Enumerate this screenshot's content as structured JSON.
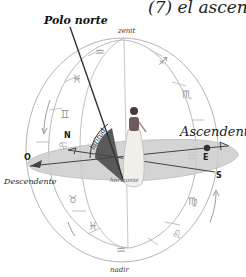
{
  "title_fragment": "(7) el ascen",
  "labels": {
    "polo_norte": "Polo norte",
    "zenit": "zenit",
    "nadir": "nadir",
    "ascendente": "Ascendente",
    "descendente": "Descendente",
    "horizonte": "horizonte",
    "latitud": "latitud"
  },
  "cardinals": {
    "north": "N",
    "south": "S",
    "east": "E",
    "west": "O"
  },
  "zodiac_signs": {
    "top_left_1": "♒",
    "top_left_2": "♓",
    "left": "♊",
    "left_low": "♋",
    "top_right": "♐",
    "right": "♏",
    "right_low_1": "♍",
    "right_low_2": "♌",
    "bottom_left_1": "♉",
    "bottom_left_2": "♓",
    "bottom": "♒",
    "horizon_right": "♎"
  },
  "colors": {
    "horizon_plane": "#c8c8c8",
    "latitude_wedge": "#5a5a5a",
    "line": "#333333",
    "sphere_line": "#b5b5b5",
    "ascendant_dot": "#333333"
  }
}
